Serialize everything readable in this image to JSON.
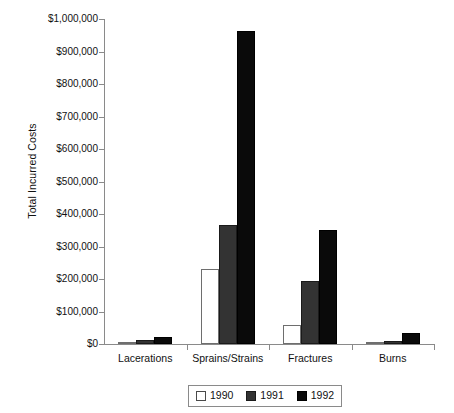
{
  "chart_data": {
    "type": "bar",
    "title": "",
    "xlabel": "",
    "ylabel": "Total Incurred Costs",
    "categories": [
      "Lacerations",
      "Sprains/Strains",
      "Fractures",
      "Burns"
    ],
    "series": [
      {
        "name": "1990",
        "color": "#ffffff",
        "values": [
          7000,
          231000,
          59000,
          5000
        ]
      },
      {
        "name": "1991",
        "color": "#333333",
        "values": [
          13000,
          367000,
          194000,
          8000
        ]
      },
      {
        "name": "1992",
        "color": "#0a0a0a",
        "values": [
          23000,
          963000,
          352000,
          35000
        ]
      }
    ],
    "ylim": [
      0,
      1000000
    ],
    "ytick_values": [
      0,
      100000,
      200000,
      300000,
      400000,
      500000,
      600000,
      700000,
      800000,
      900000,
      1000000
    ],
    "ytick_labels": [
      "$0",
      "$100,000",
      "$200,000",
      "$300,000",
      "$400,000",
      "$500,000",
      "$600,000",
      "$700,000",
      "$800,000",
      "$900,000",
      "$1,000,000"
    ],
    "grid": false,
    "legend_position": "bottom",
    "legend_entries": [
      "1990",
      "1991",
      "1992"
    ]
  },
  "axis": {
    "y_title": "Total Incurred Costs"
  }
}
